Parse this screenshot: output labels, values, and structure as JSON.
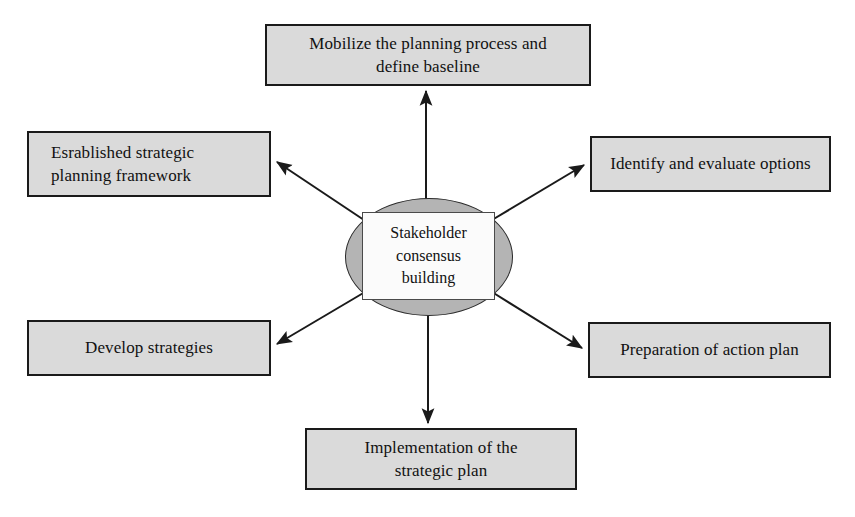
{
  "diagram": {
    "type": "hub-and-spoke",
    "center": {
      "label": "Stakeholder\nconsensus\nbuilding",
      "shape": "ellipse",
      "fill": "#b4b4b4",
      "label_box_fill": "#fbfbfb"
    },
    "node_fill": "#dadada",
    "node_border": "#1a1a1a",
    "arrow_color": "#1a1a1a",
    "nodes": [
      {
        "id": "mobilize",
        "label": "Mobilize the planning process and\ndefine baseline",
        "position": "top",
        "align": "center"
      },
      {
        "id": "established",
        "label": "Esrablished strategic\nplanning framework",
        "position": "upper-left",
        "align": "left"
      },
      {
        "id": "identify",
        "label": "Identify and evaluate options",
        "position": "upper-right",
        "align": "center"
      },
      {
        "id": "develop",
        "label": "Develop strategies",
        "position": "lower-left",
        "align": "center"
      },
      {
        "id": "preparation",
        "label": "Preparation of action plan",
        "position": "lower-right",
        "align": "center"
      },
      {
        "id": "implementation",
        "label": "Implementation of the\nstrategic plan",
        "position": "bottom",
        "align": "center"
      }
    ],
    "connectors": [
      {
        "from": "center",
        "to": "mobilize",
        "direction": "up"
      },
      {
        "from": "center",
        "to": "established",
        "direction": "upper-left"
      },
      {
        "from": "center",
        "to": "identify",
        "direction": "upper-right"
      },
      {
        "from": "center",
        "to": "develop",
        "direction": "lower-left"
      },
      {
        "from": "center",
        "to": "preparation",
        "direction": "lower-right"
      },
      {
        "from": "center",
        "to": "implementation",
        "direction": "down"
      }
    ]
  }
}
